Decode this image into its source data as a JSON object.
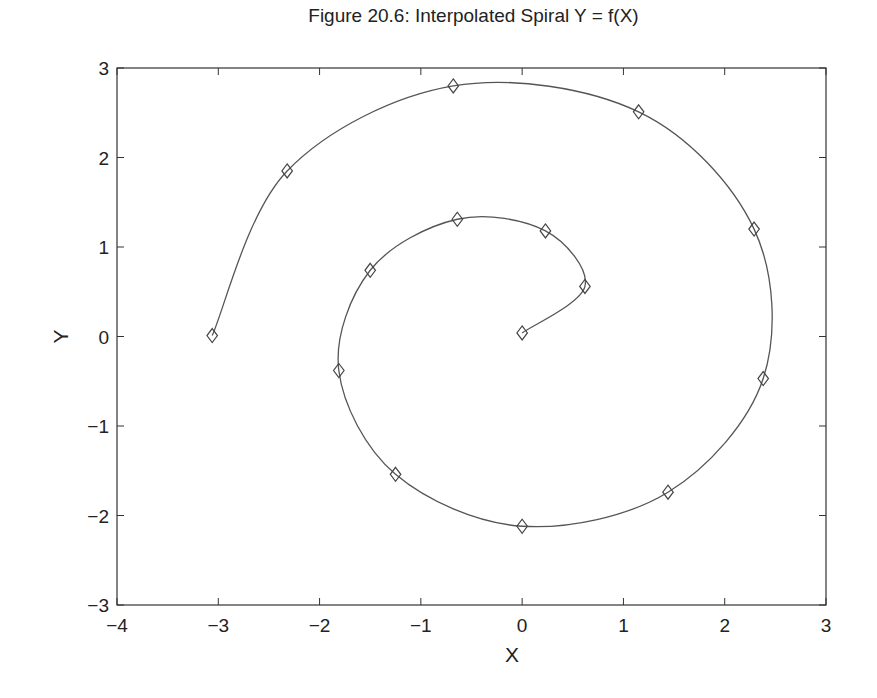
{
  "chart_data": {
    "type": "line",
    "title": "Figure 20.6: Interpolated Spiral Y = f(X)",
    "xlabel": "X",
    "ylabel": "Y",
    "xlim": [
      -4,
      3
    ],
    "ylim": [
      -3,
      3
    ],
    "xticks": [
      -4,
      -3,
      -2,
      -1,
      0,
      1,
      2,
      3
    ],
    "yticks": [
      -3,
      -2,
      -1,
      0,
      1,
      2,
      3
    ],
    "xtick_labels": [
      "−4",
      "−3",
      "−2",
      "−1",
      "0",
      "1",
      "2",
      "3"
    ],
    "ytick_labels": [
      "−3",
      "−2",
      "−1",
      "0",
      "1",
      "2",
      "3"
    ],
    "grid": false,
    "legend": null,
    "series": [
      {
        "name": "data points",
        "marker": "diamond",
        "line": "smooth interpolated curve",
        "x": [
          0.0,
          0.62,
          0.23,
          -0.64,
          -1.5,
          -1.81,
          -1.25,
          0.0,
          1.44,
          2.38,
          2.29,
          1.15,
          -0.68,
          -2.32,
          -3.06
        ],
        "y": [
          0.04,
          0.56,
          1.18,
          1.31,
          0.74,
          -0.38,
          -1.54,
          -2.12,
          -1.74,
          -0.47,
          1.2,
          2.51,
          2.8,
          1.85,
          0.01
        ]
      }
    ]
  },
  "colors": {
    "line": "#555555",
    "axes": "#333333",
    "background": "#ffffff"
  }
}
